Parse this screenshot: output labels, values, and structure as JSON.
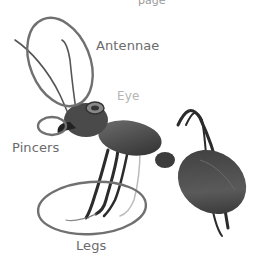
{
  "diagram": {
    "subject": "ant",
    "top_text_partial": "page",
    "labels": {
      "antennae": "Antennae",
      "eye": "Eye",
      "pincers": "Pincers",
      "legs": "Legs"
    },
    "colors": {
      "outline": "#6e6e6e",
      "label": "#6b6b6b",
      "label_light": "#b5b5b5",
      "background": "#ffffff"
    }
  }
}
